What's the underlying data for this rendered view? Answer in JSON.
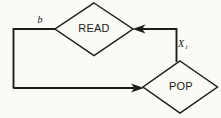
{
  "figure": {
    "type": "flowchart",
    "width": 221,
    "height": 118,
    "background_color": "#fbfaf6",
    "line_color": "#1d1d1b"
  },
  "nodes": [
    {
      "id": "read",
      "label": "READ",
      "shape": "diamond",
      "center_x": 94,
      "center_y": 29,
      "half_width": 39,
      "half_height": 26
    },
    {
      "id": "pop",
      "label": "POP",
      "shape": "diamond",
      "center_x": 180,
      "center_y": 87,
      "half_width": 37,
      "half_height": 26
    }
  ],
  "edges": [
    {
      "id": "edge-b-into-read",
      "label": "b",
      "from": "loop-left-rail",
      "to": "read",
      "arrow": false
    },
    {
      "id": "edge-read-to-pop",
      "label": "X",
      "label_subscript": "i",
      "from": "read",
      "to": "pop",
      "arrow": true,
      "arrow_direction": "left"
    },
    {
      "id": "edge-loop-into-pop",
      "label": "",
      "from": "loop-left-rail",
      "to": "pop",
      "arrow": true,
      "arrow_direction": "right"
    }
  ],
  "labels": {
    "read_label": "READ",
    "pop_label": "POP",
    "b_label": "b",
    "x_label": "X",
    "x_subscript": "i"
  }
}
